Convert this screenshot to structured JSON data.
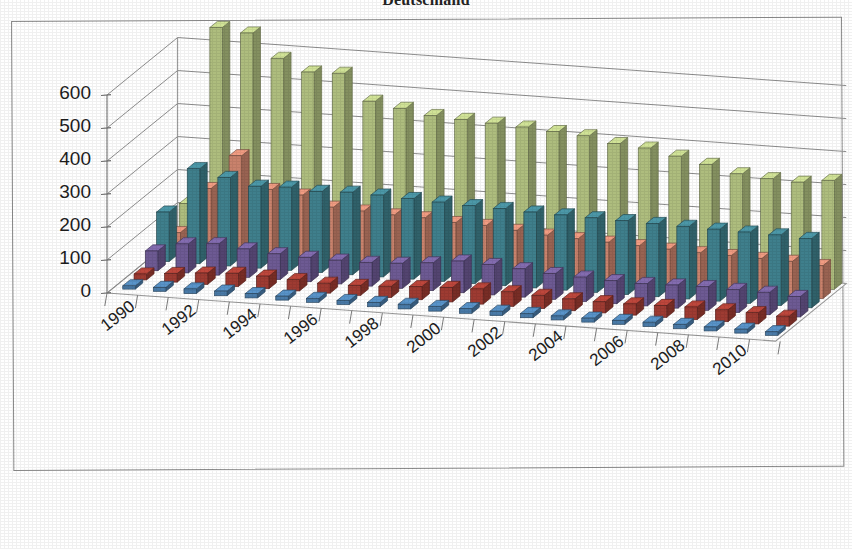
{
  "title": "Deutschland",
  "chart_data": {
    "type": "bar",
    "render": "3d-column",
    "title": "Deutschland",
    "xlabel": "",
    "ylabel": "",
    "ylim": [
      0,
      600
    ],
    "yticks": [
      0,
      100,
      200,
      300,
      400,
      500,
      600
    ],
    "grid": true,
    "legend": "none",
    "x_tick_labels": [
      "1990",
      "1992",
      "1994",
      "1996",
      "1998",
      "2000",
      "2002",
      "2004",
      "2006",
      "2008",
      "2010"
    ],
    "x_tick_step": 2,
    "categories": [
      "1990",
      "1991",
      "1992",
      "1993",
      "1994",
      "1995",
      "1996",
      "1997",
      "1998",
      "1999",
      "2000",
      "2001",
      "2002",
      "2003",
      "2004",
      "2005",
      "2006",
      "2007",
      "2008",
      "2009",
      "2010",
      "2011"
    ],
    "series": [
      {
        "name": "series-1",
        "color": "#4a7ba8",
        "depth_order": 1,
        "values": [
          10,
          12,
          14,
          14,
          13,
          12,
          12,
          12,
          13,
          14,
          14,
          14,
          13,
          13,
          12,
          12,
          12,
          13,
          13,
          12,
          12,
          11
        ]
      },
      {
        "name": "series-2",
        "color": "#9e3b32",
        "depth_order": 2,
        "values": [
          18,
          26,
          34,
          40,
          38,
          34,
          30,
          30,
          34,
          40,
          44,
          46,
          44,
          40,
          36,
          34,
          34,
          36,
          38,
          36,
          34,
          30
        ]
      },
      {
        "name": "series-3",
        "color": "#6d5a93",
        "depth_order": 3,
        "values": [
          60,
          88,
          95,
          86,
          78,
          74,
          72,
          72,
          76,
          84,
          96,
          92,
          86,
          78,
          74,
          70,
          68,
          70,
          72,
          70,
          68,
          62
        ]
      },
      {
        "name": "series-4",
        "color": "#3f7f8c",
        "depth_order": 4,
        "values": [
          150,
          288,
          268,
          248,
          252,
          246,
          250,
          248,
          244,
          240,
          236,
          234,
          230,
          228,
          226,
          224,
          222,
          220,
          218,
          216,
          214,
          210
        ]
      },
      {
        "name": "series-5",
        "color": "#c9826c",
        "depth_order": 5,
        "values": [
          60,
          200,
          306,
          210,
          200,
          170,
          165,
          160,
          158,
          150,
          148,
          140,
          132,
          128,
          124,
          120,
          116,
          112,
          110,
          108,
          106,
          100
        ]
      },
      {
        "name": "series-6",
        "color": "#aebd7e",
        "depth_order": 6,
        "values": [
          120,
          660,
          650,
          580,
          545,
          548,
          470,
          455,
          440,
          435,
          430,
          425,
          418,
          412,
          395,
          388,
          370,
          352,
          330,
          322,
          318,
          330
        ]
      }
    ]
  }
}
